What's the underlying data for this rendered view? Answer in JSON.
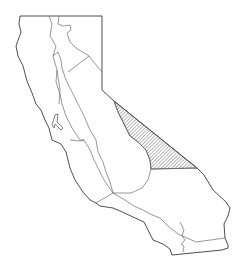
{
  "map": {
    "subject": "California regions",
    "colors": {
      "background": "#ffffff",
      "outline": "#3a3a3a",
      "boundary": "#6a6a6a",
      "hatch": "#555555"
    },
    "state_outline": "M20,16 L102,16 L102,90 L114,101 L197,168 L204,175 L213,190 L226,202 L230,208 L228,216 L224,224 L225,238 L228,245 L228,248 L222,250 L172,255 L170,249 L163,244 L153,240 L144,222 L133,217 L120,211 L113,208 L100,206 L96,203 L90,200 L83,192 L75,180 L70,168 L66,152 L61,144 L52,140 L49,128 L45,120 L41,110 L36,104 L32,93 L27,81 L23,66 L18,56 L16,46 L21,32 L19,24 Z",
    "bay": "M55,115 L58,114 L57,122 L63,128 L61,130 L55,124 L54,128 L52,125 Z",
    "boundaries": [
      "M49,16 L52,24 L50,36 L56,46 L53,56 L57,70 L60,90 L59,104",
      "M59,16 L58,24 L63,26 L70,25 L71,30 L67,33 L70,42 L76,48 L86,54 L89,56 L97,66 L102,72",
      "M89,56 L68,72",
      "M53,56 L58,52 L61,60 L62,68 L66,80 L72,92 L78,104 L84,116 L90,130 L96,140 L98,152 L103,162 L106,172 L110,182 L113,193",
      "M57,70 L56,82 L60,94 L62,104 L66,116 L72,128 L80,140 L84,140 L90,150 L94,160 L98,168 L104,180 L108,186 L113,193",
      "M114,101 L118,112 L124,124 L130,136 L138,142 L146,150 L150,160 L151,169 L148,180 L142,188 L131,193 L113,193",
      "M151,169 L197,168",
      "M70,140 L80,141 L84,140",
      "M113,193 L125,200 L134,206 L143,210 L150,214 L160,218 L168,226 L178,234 L196,242 L225,238",
      "M96,203 L113,193",
      "M180,222 L184,230 L182,236 L185,240 L181,244 L184,246 L183,252"
    ],
    "regions": [
      {
        "name": "hatched-region",
        "pattern": "diagonal-hatch",
        "path": "M114,101 L197,168 L151,169 L150,160 L146,150 L138,142 L130,136 L124,124 L118,112 Z"
      }
    ]
  }
}
